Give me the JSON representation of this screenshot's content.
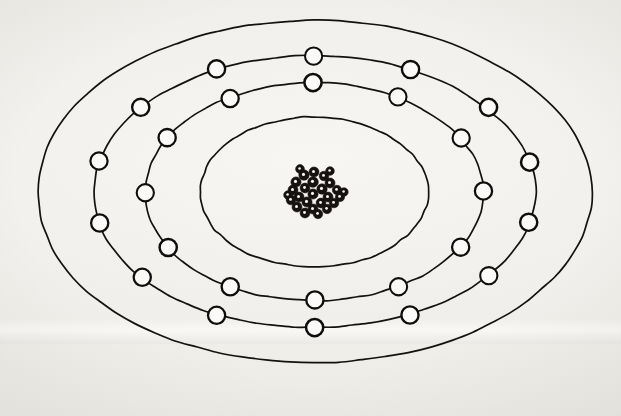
{
  "figure": {
    "title": "Bohr atomic model sketch",
    "style": "hand-drawn ink on off-white paper",
    "colors": {
      "paper": "#f2f0ec",
      "ink": "#14120f",
      "electron_fill": "#fbfaf8",
      "nucleus": "#15120f"
    },
    "canvas": {
      "width": 621,
      "height": 416
    },
    "center": {
      "x": 314,
      "y": 192
    }
  },
  "nucleus": {
    "label": "nucleus",
    "particle_count": 27,
    "cluster_radius_x": 24,
    "cluster_radius_y": 23,
    "particles": [
      {
        "x": 314,
        "y": 172,
        "r": 5.0
      },
      {
        "x": 304,
        "y": 175,
        "r": 5.2
      },
      {
        "x": 324,
        "y": 176,
        "r": 4.8
      },
      {
        "x": 296,
        "y": 182,
        "r": 5.1
      },
      {
        "x": 313,
        "y": 182,
        "r": 5.3
      },
      {
        "x": 330,
        "y": 183,
        "r": 5.0
      },
      {
        "x": 305,
        "y": 188,
        "r": 4.9
      },
      {
        "x": 322,
        "y": 189,
        "r": 5.2
      },
      {
        "x": 293,
        "y": 190,
        "r": 5.0
      },
      {
        "x": 337,
        "y": 190,
        "r": 4.7
      },
      {
        "x": 313,
        "y": 194,
        "r": 5.1
      },
      {
        "x": 299,
        "y": 197,
        "r": 5.0
      },
      {
        "x": 328,
        "y": 197,
        "r": 5.0
      },
      {
        "x": 291,
        "y": 200,
        "r": 4.8
      },
      {
        "x": 340,
        "y": 197,
        "r": 4.6
      },
      {
        "x": 307,
        "y": 202,
        "r": 5.1
      },
      {
        "x": 321,
        "y": 203,
        "r": 4.9
      },
      {
        "x": 334,
        "y": 203,
        "r": 4.8
      },
      {
        "x": 297,
        "y": 207,
        "r": 5.0
      },
      {
        "x": 313,
        "y": 209,
        "r": 5.0
      },
      {
        "x": 327,
        "y": 209,
        "r": 4.7
      },
      {
        "x": 305,
        "y": 213,
        "r": 4.9
      },
      {
        "x": 318,
        "y": 214,
        "r": 4.7
      },
      {
        "x": 300,
        "y": 169,
        "r": 4.4
      },
      {
        "x": 330,
        "y": 171,
        "r": 4.3
      },
      {
        "x": 288,
        "y": 195,
        "r": 4.3
      },
      {
        "x": 344,
        "y": 192,
        "r": 4.2
      }
    ]
  },
  "shells": [
    {
      "name": "shell-1-outer",
      "index": 1,
      "ring_label": "outermost shell",
      "rx": 277,
      "ry": 171,
      "stroke_width": 1.7,
      "electron_count": 0,
      "electron_radius": 0,
      "electron_angles": []
    },
    {
      "name": "shell-2",
      "index": 2,
      "ring_label": "second shell",
      "rx": 221,
      "ry": 136,
      "stroke_width": 1.7,
      "electron_count": 14,
      "electron_radius": 8.6,
      "electron_angles": [
        0,
        26,
        52,
        77,
        103,
        128,
        154,
        180,
        206,
        231,
        257,
        283,
        308,
        334
      ]
    },
    {
      "name": "shell-3",
      "index": 3,
      "ring_label": "third shell",
      "rx": 169,
      "ry": 109,
      "stroke_width": 1.7,
      "electron_count": 12,
      "electron_radius": 8.6,
      "electron_angles": [
        0,
        30,
        60,
        90,
        120,
        150,
        180,
        210,
        240,
        270,
        300,
        330
      ]
    },
    {
      "name": "shell-4-inner",
      "index": 4,
      "ring_label": "innermost shell",
      "rx": 114,
      "ry": 75,
      "stroke_width": 1.7,
      "electron_count": 0,
      "electron_radius": 0,
      "electron_angles": []
    }
  ],
  "totals": {
    "shell_count": 4,
    "electron_total": 26,
    "shells_with_electrons": 2
  }
}
